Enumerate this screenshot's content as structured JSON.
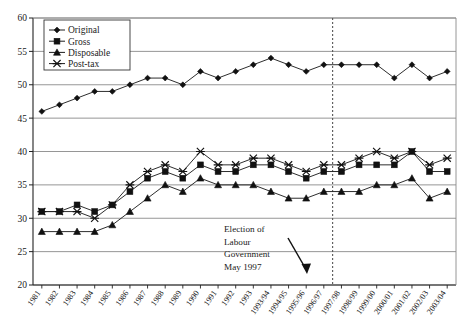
{
  "chart_data": {
    "type": "line",
    "title": "",
    "xlabel": "",
    "ylabel": "",
    "ylim": [
      20,
      60
    ],
    "yticks": [
      20,
      25,
      30,
      35,
      40,
      45,
      50,
      55,
      60
    ],
    "grid": true,
    "legend_position": "top-left",
    "categories": [
      "1981",
      "1982",
      "1983",
      "1984",
      "1985",
      "1986",
      "1987",
      "1988",
      "1989",
      "1990",
      "1991",
      "1992",
      "1993",
      "1993/94",
      "1994/95",
      "1995/96",
      "1996/97",
      "1997/98",
      "1998/99",
      "1999/00",
      "2000/01",
      "2001/02",
      "2002/03",
      "2003/04"
    ],
    "series": [
      {
        "name": "Original",
        "marker": "diamond",
        "values": [
          46,
          47,
          48,
          49,
          49,
          50,
          51,
          51,
          50,
          52,
          51,
          52,
          53,
          54,
          53,
          52,
          53,
          53,
          53,
          53,
          51,
          53,
          51,
          52
        ]
      },
      {
        "name": "Gross",
        "marker": "square",
        "values": [
          31,
          31,
          32,
          31,
          32,
          34,
          36,
          37,
          36,
          38,
          37,
          37,
          38,
          38,
          37,
          36,
          37,
          37,
          38,
          38,
          38,
          40,
          37,
          37
        ]
      },
      {
        "name": "Disposable",
        "marker": "triangle",
        "values": [
          28,
          28,
          28,
          28,
          29,
          31,
          33,
          35,
          34,
          36,
          35,
          35,
          35,
          34,
          33,
          33,
          34,
          34,
          34,
          35,
          35,
          36,
          33,
          34
        ]
      },
      {
        "name": "Post-tax",
        "marker": "cross",
        "values": [
          31,
          31,
          31,
          30,
          32,
          35,
          37,
          38,
          37,
          40,
          38,
          38,
          39,
          39,
          38,
          37,
          38,
          38,
          39,
          40,
          39,
          40,
          38,
          39
        ]
      }
    ],
    "annotations": [
      {
        "name": "election-annotation",
        "lines": [
          "Election of",
          "Labour",
          "Government",
          "May 1997"
        ],
        "marker_line_x_category": "1996/97",
        "arrow": true
      }
    ],
    "vertical_marker": {
      "after_category": "1996/97",
      "style": "dotted"
    },
    "colors": {
      "series_line": "#222222",
      "grid": "#8a8a8a",
      "axis": "#222222",
      "background": "#ffffff"
    }
  },
  "legend": {
    "items": [
      {
        "label": "Original"
      },
      {
        "label": "Gross"
      },
      {
        "label": "Disposable"
      },
      {
        "label": "Post-tax"
      }
    ]
  }
}
